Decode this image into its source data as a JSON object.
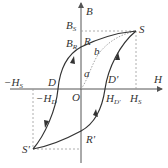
{
  "diagram": {
    "type": "hysteresis-loop",
    "axes": {
      "x_label": "H",
      "y_label": "B",
      "origin_label": "O"
    },
    "points": {
      "S": "S",
      "S_prime": "S'",
      "R": "R",
      "R_prime": "R'",
      "D": "D",
      "D_prime": "D'",
      "a": "a",
      "b": "b"
    },
    "ticks": {
      "B_S": {
        "main": "B",
        "sub": "S"
      },
      "B_R": {
        "main": "B",
        "sub": "R"
      },
      "H_S": {
        "main": "H",
        "sub": "S"
      },
      "neg_H_S": {
        "main": "−H",
        "sub": "S"
      },
      "neg_H_D": {
        "main": "−H",
        "sub": "D"
      },
      "H_D_prime": {
        "main": "H",
        "sub": "D'"
      }
    },
    "colors": {
      "curve": "#333333",
      "axis": "#555555",
      "dashed": "#999999"
    }
  }
}
